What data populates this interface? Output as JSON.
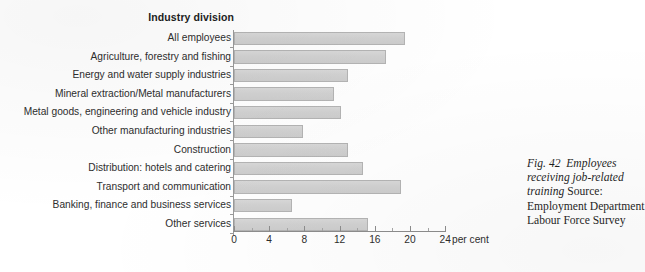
{
  "chart_data": {
    "type": "bar",
    "orientation": "horizontal",
    "title": "Industry division",
    "xlabel": "per cent",
    "ylabel": "Industry division",
    "xlim": [
      0,
      24
    ],
    "xticks": [
      0,
      4,
      8,
      12,
      16,
      20,
      24
    ],
    "xtick_labels": [
      "0",
      "4",
      "8",
      "12",
      "16",
      "20",
      "24"
    ],
    "minor_tick_step": 2,
    "grid": false,
    "legend": false,
    "bar_color": "#d2d2d2",
    "bar_border_color": "#b4b4b4",
    "categories": [
      "All employees",
      "Agriculture, forestry and fishing",
      "Energy and water supply industries",
      "Mineral extraction/Metal manufacturers",
      "Metal goods, engineering and vehicle industry",
      "Other manufacturing industries",
      "Construction",
      "Distribution: hotels and catering",
      "Transport and communication",
      "Banking, finance and business services",
      "Other services"
    ],
    "values": [
      19.4,
      17.3,
      12.9,
      11.4,
      12.2,
      7.8,
      13.0,
      14.7,
      19.0,
      6.6,
      15.2
    ]
  },
  "caption": {
    "figure_label": "Fig. 42",
    "title": "Employees receiving job-related training",
    "source": "Source: Employment Department Labour Force Survey"
  }
}
